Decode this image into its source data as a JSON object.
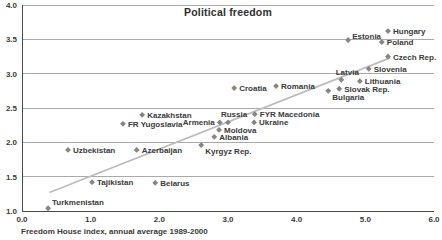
{
  "chart_data": {
    "type": "scatter",
    "title": "Political freedom",
    "xlabel": "Freedom House index, annual average 1989-2000",
    "ylabel": "",
    "xlim": [
      0,
      6
    ],
    "ylim": [
      1,
      4
    ],
    "x_ticks": [
      "0.0",
      "1.0",
      "2.0",
      "3.0",
      "4.0",
      "5.0",
      "6.0"
    ],
    "y_ticks": [
      "1.0",
      "1.5",
      "2.0",
      "2.5",
      "3.0",
      "3.5",
      "4.0"
    ],
    "grid": "horizontal",
    "legend": "none",
    "marker": "diamond",
    "colors": {
      "marker": "#858585",
      "trendline": "#bcbcbc",
      "gridline": "#a9a9a9",
      "axis": "#4a4a4a",
      "text": "#3a3a3a",
      "background": "#ffffff"
    },
    "trendline": {
      "x1": 0.4,
      "y1": 1.27,
      "x2": 5.36,
      "y2": 3.23
    },
    "points": [
      {
        "name": "Turkmenistan",
        "x": 0.38,
        "y": 1.04,
        "placement": "above-right"
      },
      {
        "name": "Uzbekistan",
        "x": 0.67,
        "y": 1.89,
        "placement": "right"
      },
      {
        "name": "Tajikistan",
        "x": 1.02,
        "y": 1.42,
        "placement": "right"
      },
      {
        "name": "FR Yugoslavia",
        "x": 1.47,
        "y": 2.27,
        "placement": "right"
      },
      {
        "name": "Azerbaijan",
        "x": 1.67,
        "y": 1.89,
        "placement": "right"
      },
      {
        "name": "Kazakhstan",
        "x": 1.75,
        "y": 2.4,
        "placement": "right"
      },
      {
        "name": "Belarus",
        "x": 1.94,
        "y": 1.41,
        "placement": "right"
      },
      {
        "name": "Kyrgyz Rep.",
        "x": 2.61,
        "y": 1.96,
        "placement": "below-right"
      },
      {
        "name": "Albania",
        "x": 2.8,
        "y": 2.08,
        "placement": "right"
      },
      {
        "name": "Moldova",
        "x": 2.87,
        "y": 2.18,
        "placement": "right"
      },
      {
        "name": "Armenia",
        "x": 2.88,
        "y": 2.29,
        "placement": "left"
      },
      {
        "name": "Russia",
        "x": 3.0,
        "y": 2.29,
        "placement": "above"
      },
      {
        "name": "Croatia",
        "x": 3.09,
        "y": 2.79,
        "placement": "right"
      },
      {
        "name": "Ukraine",
        "x": 3.38,
        "y": 2.29,
        "placement": "right"
      },
      {
        "name": "FYR Macedonia",
        "x": 3.39,
        "y": 2.41,
        "placement": "right"
      },
      {
        "name": "Romania",
        "x": 3.7,
        "y": 2.82,
        "placement": "right"
      },
      {
        "name": "Bulgaria",
        "x": 4.46,
        "y": 2.75,
        "placement": "below-right"
      },
      {
        "name": "Slovak Rep.",
        "x": 4.62,
        "y": 2.78,
        "placement": "right"
      },
      {
        "name": "Latvia",
        "x": 4.65,
        "y": 2.91,
        "placement": "above"
      },
      {
        "name": "Estonia",
        "x": 4.75,
        "y": 3.49,
        "placement": "right-up"
      },
      {
        "name": "Lithuania",
        "x": 4.92,
        "y": 2.89,
        "placement": "right"
      },
      {
        "name": "Slovenia",
        "x": 5.05,
        "y": 3.07,
        "placement": "right"
      },
      {
        "name": "Poland",
        "x": 5.24,
        "y": 3.46,
        "placement": "right"
      },
      {
        "name": "Czech Rep.",
        "x": 5.33,
        "y": 3.25,
        "placement": "right"
      },
      {
        "name": "Hungary",
        "x": 5.33,
        "y": 3.62,
        "placement": "right"
      }
    ]
  }
}
